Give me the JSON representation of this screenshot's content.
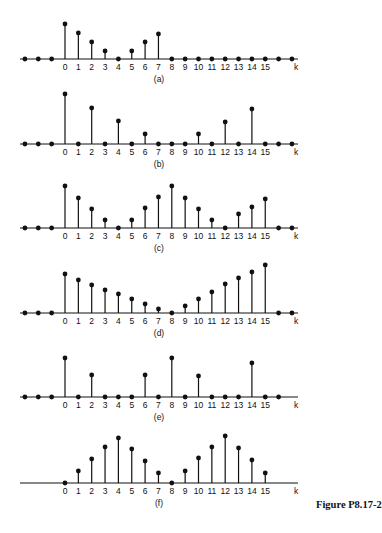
{
  "figure": {
    "caption": "Figure P8.17-2",
    "axis_label": "k",
    "ink_color": "#111111"
  },
  "chart_data": [
    {
      "type": "stem",
      "panel": "(a)",
      "xlabel": "k",
      "x": [
        -3,
        -2,
        -1,
        0,
        1,
        2,
        3,
        4,
        5,
        6,
        7,
        8,
        9,
        10,
        11,
        12,
        13,
        14,
        15,
        16,
        17
      ],
      "values": [
        0,
        0,
        0,
        35,
        26,
        17,
        8,
        0,
        8,
        17,
        25,
        0,
        0,
        0,
        0,
        0,
        0,
        0,
        0,
        0,
        0
      ],
      "tick_labels": [
        "0",
        "1",
        "2",
        "3",
        "4",
        "5",
        "6",
        "7",
        "8",
        "9",
        "10",
        "11",
        "12",
        "13",
        "14",
        "15"
      ],
      "baseline_y": 59
    },
    {
      "type": "stem",
      "panel": "(b)",
      "xlabel": "k",
      "x": [
        -3,
        -2,
        -1,
        0,
        1,
        2,
        3,
        4,
        5,
        6,
        7,
        8,
        9,
        10,
        11,
        12,
        13,
        14,
        15,
        16,
        17
      ],
      "values": [
        0,
        0,
        0,
        50,
        0,
        36,
        0,
        23,
        0,
        10,
        0,
        0,
        0,
        10,
        0,
        22,
        0,
        35,
        0,
        0,
        0
      ],
      "tick_labels": [
        "0",
        "1",
        "2",
        "3",
        "4",
        "5",
        "6",
        "7",
        "8",
        "9",
        "10",
        "11",
        "12",
        "13",
        "14",
        "15"
      ],
      "baseline_y": 144
    },
    {
      "type": "stem",
      "panel": "(c)",
      "xlabel": "k",
      "x": [
        -3,
        -2,
        -1,
        0,
        1,
        2,
        3,
        4,
        5,
        6,
        7,
        8,
        9,
        10,
        11,
        12,
        13,
        14,
        15,
        16,
        17
      ],
      "values": [
        0,
        0,
        0,
        42,
        30,
        19,
        8,
        0,
        8,
        20,
        31,
        42,
        30,
        19,
        8,
        0,
        14,
        21,
        29,
        0,
        0
      ],
      "tick_labels": [
        "0",
        "1",
        "2",
        "3",
        "4",
        "5",
        "6",
        "7",
        "8",
        "9",
        "10",
        "11",
        "12",
        "13",
        "14",
        "15"
      ],
      "baseline_y": 228
    },
    {
      "type": "stem",
      "panel": "(d)",
      "xlabel": "k",
      "x": [
        -3,
        -2,
        -1,
        0,
        1,
        2,
        3,
        4,
        5,
        6,
        7,
        8,
        9,
        10,
        11,
        12,
        13,
        14,
        15,
        16,
        17
      ],
      "values": [
        0,
        0,
        0,
        39,
        33,
        28,
        23,
        19,
        14,
        9,
        4,
        0,
        7,
        14,
        21,
        29,
        35,
        41,
        48,
        0,
        0
      ],
      "tick_labels": [
        "0",
        "1",
        "2",
        "3",
        "4",
        "5",
        "6",
        "7",
        "8",
        "9",
        "10",
        "11",
        "12",
        "13",
        "14",
        "15"
      ],
      "baseline_y": 313
    },
    {
      "type": "stem",
      "panel": "(e)",
      "xlabel": "k",
      "x": [
        -3,
        -2,
        -1,
        0,
        1,
        2,
        3,
        4,
        5,
        6,
        7,
        8,
        9,
        10,
        11,
        12,
        13,
        14,
        15,
        16
      ],
      "values": [
        0,
        0,
        0,
        39,
        0,
        22,
        0,
        0,
        0,
        22,
        0,
        39,
        0,
        21,
        0,
        0,
        0,
        34,
        0,
        0
      ],
      "tick_labels": [
        "0",
        "1",
        "2",
        "3",
        "4",
        "5",
        "6",
        "7",
        "8",
        "9",
        "10",
        "11",
        "12",
        "13",
        "14",
        "15"
      ],
      "baseline_y": 397
    },
    {
      "type": "stem",
      "panel": "(f)",
      "xlabel": "k",
      "x": [
        0,
        1,
        2,
        3,
        4,
        5,
        6,
        7,
        8,
        9,
        10,
        11,
        12,
        13,
        14,
        15
      ],
      "values": [
        0,
        12,
        24,
        36,
        45,
        34,
        22,
        10,
        0,
        12,
        25,
        36,
        47,
        35,
        23,
        10
      ],
      "tick_labels": [
        "0",
        "1",
        "2",
        "3",
        "4",
        "5",
        "6",
        "7",
        "8",
        "9",
        "10",
        "11",
        "12",
        "13",
        "14",
        "15"
      ],
      "baseline_y": 483
    }
  ]
}
